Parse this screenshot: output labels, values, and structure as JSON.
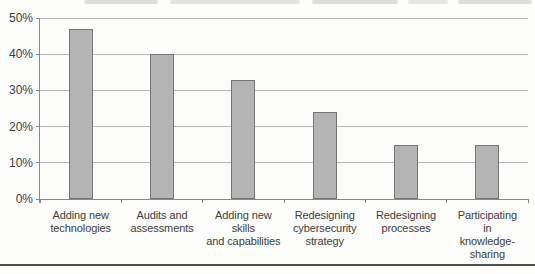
{
  "chart_data": {
    "type": "bar",
    "title": "",
    "xlabel": "",
    "ylabel": "",
    "categories": [
      "Adding new technologies",
      "Audits and assessments",
      "Adding new skills and capabilities",
      "Redesigning cybersecurity strategy",
      "Redesigning processes",
      "Participating in knowledge-sharing"
    ],
    "category_label_lines": [
      [
        "Adding new",
        "technologies"
      ],
      [
        "Audits and",
        "assessments"
      ],
      [
        "Adding new",
        "skills",
        "and capabilities"
      ],
      [
        "Redesigning",
        "cybersecurity",
        "strategy"
      ],
      [
        "Redesigning",
        "processes"
      ],
      [
        "Participating",
        "in",
        "knowledge-",
        "sharing"
      ]
    ],
    "values": [
      47,
      40,
      33,
      24,
      15,
      15
    ],
    "value_unit": "%",
    "ylim": [
      0,
      50
    ],
    "ytick_values": [
      0,
      10,
      20,
      30,
      40,
      50
    ],
    "ytick_labels": [
      "0%",
      "10%",
      "20%",
      "30%",
      "40%",
      "50%"
    ],
    "grid": "horizontal",
    "legend": "none",
    "colors": {
      "page_background": "#fdfdfb",
      "bar_fill": "#b4b4b4",
      "bar_border": "#757575",
      "gridline": "#b5b5b5",
      "axis": "#8a8a8a",
      "label_text": "#3d3d3d",
      "divider": "#4f4f4f"
    }
  }
}
